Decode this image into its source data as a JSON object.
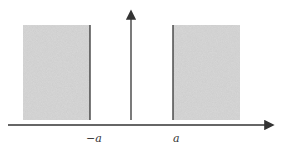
{
  "diagram": {
    "labels": {
      "left_wall": "−a",
      "right_wall": "a"
    },
    "colors": {
      "shade": "#c8c8c8",
      "line": "#333333"
    }
  }
}
